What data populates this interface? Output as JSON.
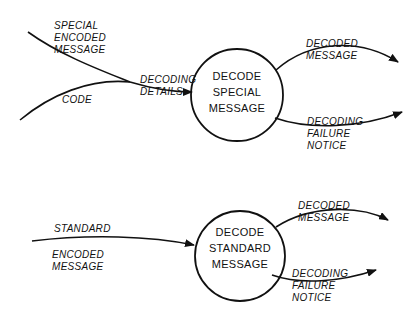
{
  "diagram": {
    "type": "data-flow-diagram",
    "processes": [
      {
        "id": "p1",
        "lines": [
          "Decode",
          "Special",
          "Message"
        ]
      },
      {
        "id": "p2",
        "lines": [
          "Decode",
          "Standard",
          "Message"
        ]
      }
    ],
    "flows": [
      {
        "id": "f1",
        "lines": [
          "Special",
          "Encoded",
          "Message"
        ]
      },
      {
        "id": "f2",
        "lines": [
          "Code"
        ]
      },
      {
        "id": "f3",
        "lines": [
          "Decoding",
          "Details"
        ]
      },
      {
        "id": "f4",
        "lines": [
          "Decoded",
          "Message"
        ]
      },
      {
        "id": "f5",
        "lines": [
          "Decoding",
          "Failure",
          "Notice"
        ]
      },
      {
        "id": "f6",
        "lines": [
          "Standard"
        ]
      },
      {
        "id": "f6b",
        "lines": [
          "Encoded",
          "Message"
        ]
      },
      {
        "id": "f7",
        "lines": [
          "Decoded",
          "Message"
        ]
      },
      {
        "id": "f8",
        "lines": [
          "Decoding",
          "Failure",
          "Notice"
        ]
      }
    ],
    "colors": {
      "ink": "#111111",
      "background": "#ffffff"
    }
  }
}
